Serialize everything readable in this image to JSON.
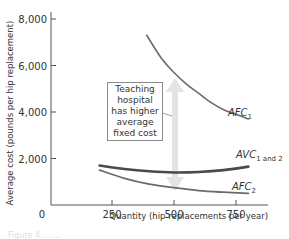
{
  "chart_data": {
    "type": "line",
    "title": "",
    "xlabel": "Quantity (hip replacements per year)",
    "ylabel": "Average cost (pounds per hip replacement)",
    "xlim": [
      0,
      870
    ],
    "ylim": [
      0,
      8500
    ],
    "x_ticks": [
      0,
      250,
      500,
      750
    ],
    "x_tick_labels": [
      "0",
      "250",
      "500",
      "750"
    ],
    "y_ticks": [
      2000,
      4000,
      6000,
      8000
    ],
    "y_tick_labels": [
      "2,000",
      "4,000",
      "6,000",
      "8,000"
    ],
    "grid": false,
    "series": [
      {
        "name": "AFC1",
        "label_main": "AFC",
        "label_sub": "1",
        "color": "#6b6b6b",
        "x": [
          390,
          450,
          500,
          550,
          600,
          650,
          700,
          750,
          800
        ],
        "y": [
          7300,
          6300,
          5700,
          5200,
          4800,
          4400,
          4100,
          3900,
          3700
        ]
      },
      {
        "name": "AVC1 and 2",
        "label_main": "AVC",
        "label_sub": "1 and 2",
        "color": "#4a4a4a",
        "x": [
          200,
          300,
          400,
          500,
          600,
          700,
          800
        ],
        "y": [
          1700,
          1550,
          1450,
          1400,
          1420,
          1500,
          1650
        ]
      },
      {
        "name": "AFC2",
        "label_main": "AFC",
        "label_sub": "2",
        "color": "#6b6b6b",
        "x": [
          200,
          300,
          400,
          500,
          600,
          700,
          800
        ],
        "y": [
          1500,
          1150,
          900,
          750,
          620,
          550,
          500
        ]
      }
    ],
    "annotations": [
      {
        "text": "Teaching hospital has higher average fixed cost",
        "type": "callout_box",
        "arrow": "double-headed vertical at Q=500 from AFC1 to AFC2"
      }
    ]
  },
  "callout": {
    "lines": [
      "Teaching",
      "hospital",
      "has higher",
      "average",
      "fixed cost"
    ]
  },
  "caption": "Figure 4 ... ..."
}
